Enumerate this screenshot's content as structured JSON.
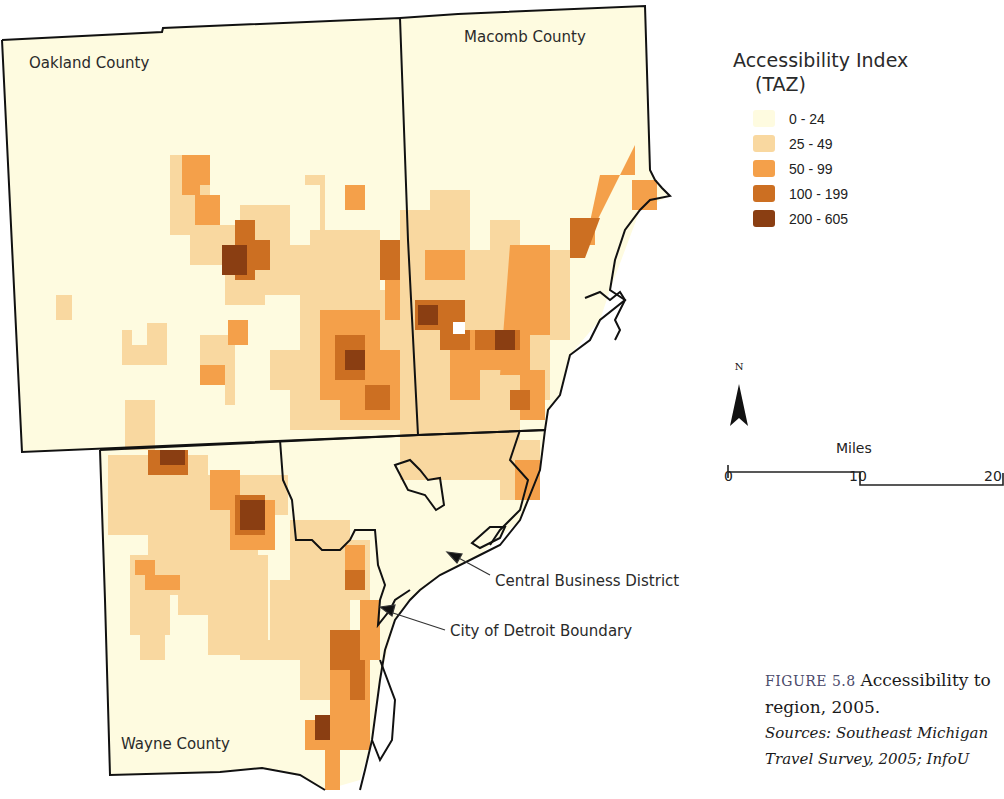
{
  "map": {
    "counties": [
      {
        "name": "Oakland County"
      },
      {
        "name": "Macomb County"
      },
      {
        "name": "Wayne County"
      }
    ],
    "callouts": {
      "cbd": "Central Business District",
      "detroit_boundary": "City of Detroit Boundary"
    }
  },
  "legend": {
    "title": "Accessibility Index",
    "subtitle": "(TAZ)",
    "classes": [
      {
        "label": "0 - 24",
        "color": "#fefbe0"
      },
      {
        "label": "25 - 49",
        "color": "#f9d8a0"
      },
      {
        "label": "50 - 99",
        "color": "#f4a04a"
      },
      {
        "label": "100 - 199",
        "color": "#cc6f22"
      },
      {
        "label": "200 - 605",
        "color": "#8a3e12"
      }
    ]
  },
  "north_arrow": {
    "letter": "N"
  },
  "scale_bar": {
    "title": "Miles",
    "ticks": [
      "0",
      "10",
      "20"
    ]
  },
  "caption": {
    "figure_label": "FIGURE 5.8",
    "title_line1": "Accessibility to",
    "title_line2": "region, 2005.",
    "sources_line1": "Sources: Southeast Michigan",
    "sources_line2": "Travel Survey, 2005; InfoU"
  }
}
